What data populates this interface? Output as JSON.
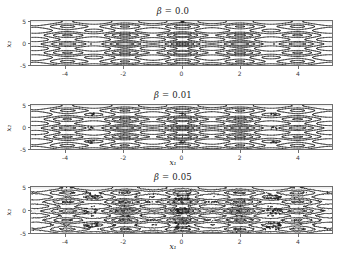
{
  "figure": {
    "background": "#ffffff",
    "contour_color": "#1a1a1a",
    "axis_color": "#6f6f6f",
    "grid_color": "#cccccc"
  },
  "panels": [
    {
      "id": "beta-0",
      "title_symbol": "β = ",
      "title_value": "0.0",
      "beta": 0.0,
      "noise": 0.0,
      "xlabel": "",
      "ylabel": "x₂",
      "xticks": [
        "-4",
        "-2",
        "0",
        "2",
        "4"
      ],
      "xtick_values": [
        -4,
        -2,
        0,
        2,
        4
      ],
      "yticks": [
        "5",
        "0",
        "-5"
      ],
      "ytick_values": [
        5,
        0,
        -5
      ]
    },
    {
      "id": "beta-001",
      "title_symbol": "β = ",
      "title_value": "0.01",
      "beta": 0.01,
      "noise": 0.01,
      "xlabel": "x₁",
      "ylabel": "x₂",
      "xticks": [
        "-4",
        "-2",
        "0",
        "2",
        "4"
      ],
      "xtick_values": [
        -4,
        -2,
        0,
        2,
        4
      ],
      "yticks": [
        "5",
        "0",
        "-5"
      ],
      "ytick_values": [
        5,
        0,
        -5
      ]
    },
    {
      "id": "beta-005",
      "title_symbol": "β = ",
      "title_value": "0.05",
      "beta": 0.05,
      "noise": 0.05,
      "xlabel": "x₁",
      "ylabel": "x₂",
      "xticks": [
        "-4",
        "-2",
        "0",
        "2",
        "4"
      ],
      "xtick_values": [
        -4,
        -2,
        0,
        2,
        4
      ],
      "yticks": [
        "5",
        "0",
        "-5"
      ],
      "ytick_values": [
        5,
        0,
        -5
      ]
    }
  ],
  "chart_data": {
    "type": "line",
    "subtype": "contour",
    "title": "",
    "panel_count": 3,
    "shared": {
      "xlabel": "x₁",
      "ylabel": "x₂",
      "xlim": [
        -5.2,
        5.2
      ],
      "ylim": [
        -5.2,
        5.2
      ],
      "grid": true,
      "legend": "none",
      "contour_levels": [
        2,
        6,
        12,
        20,
        30,
        42
      ],
      "minima_x": [
        -3.14,
        0,
        3.14
      ],
      "minima_y": [
        -3.14,
        0,
        3.14
      ],
      "aspect": "wide"
    },
    "series": [
      {
        "name": "β = 0.0",
        "beta": 0.0,
        "noise_amplitude": 0.0,
        "description": "Smooth nested elliptical contours around periodic minima; basins clean and well separated.",
        "xlim": [
          -5.2,
          5.2
        ],
        "ylim": [
          -5.2,
          5.2
        ],
        "xticks": [
          -4,
          -2,
          0,
          2,
          4
        ],
        "yticks": [
          -5,
          0,
          5
        ]
      },
      {
        "name": "β = 0.01",
        "beta": 0.01,
        "noise_amplitude": 0.01,
        "description": "Nearly smooth contours with small ragged blobs forming at the deepest minima.",
        "xlim": [
          -5.2,
          5.2
        ],
        "ylim": [
          -5.2,
          5.2
        ],
        "xticks": [
          -4,
          -2,
          0,
          2,
          4
        ],
        "yticks": [
          -5,
          0,
          5
        ]
      },
      {
        "name": "β = 0.05",
        "beta": 0.05,
        "noise_amplitude": 0.05,
        "description": "Heavily fragmented, noisy contours; inner level sets break into dense speckled clusters around each minimum.",
        "xlim": [
          -5.2,
          5.2
        ],
        "ylim": [
          -5.2,
          5.2
        ],
        "xticks": [
          -4,
          -2,
          0,
          2,
          4
        ],
        "yticks": [
          -5,
          0,
          5
        ]
      }
    ]
  }
}
